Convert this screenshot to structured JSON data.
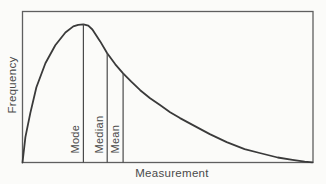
{
  "figure": {
    "y_axis_label": "Frequency",
    "x_axis_label": "Measurement"
  },
  "chart_data": {
    "type": "line",
    "title": "",
    "xlabel": "Measurement",
    "ylabel": "Frequency",
    "axis_ticks": "none",
    "grid": false,
    "legend": "none",
    "colors": {
      "curve": "#3a3a3a",
      "marker_line": "#4a4a4a",
      "frame": "#5f5f5f",
      "text": "#4a4a4a",
      "background": "#fbfbf9"
    },
    "curve_points_normalized": [
      [
        0.0,
        0.0
      ],
      [
        0.01,
        0.168
      ],
      [
        0.027,
        0.327
      ],
      [
        0.048,
        0.498
      ],
      [
        0.079,
        0.657
      ],
      [
        0.113,
        0.776
      ],
      [
        0.148,
        0.861
      ],
      [
        0.175,
        0.901
      ],
      [
        0.192,
        0.912
      ],
      [
        0.21,
        0.915
      ],
      [
        0.227,
        0.906
      ],
      [
        0.241,
        0.881
      ],
      [
        0.268,
        0.802
      ],
      [
        0.292,
        0.723
      ],
      [
        0.32,
        0.65
      ],
      [
        0.347,
        0.59
      ],
      [
        0.375,
        0.535
      ],
      [
        0.406,
        0.479
      ],
      [
        0.44,
        0.426
      ],
      [
        0.474,
        0.38
      ],
      [
        0.509,
        0.333
      ],
      [
        0.543,
        0.294
      ],
      [
        0.588,
        0.248
      ],
      [
        0.646,
        0.188
      ],
      [
        0.704,
        0.135
      ],
      [
        0.766,
        0.089
      ],
      [
        0.818,
        0.063
      ],
      [
        0.88,
        0.033
      ],
      [
        0.931,
        0.017
      ],
      [
        0.973,
        0.005
      ],
      [
        1.0,
        0.001
      ]
    ],
    "markers": [
      {
        "label": "Mode",
        "x": 0.21,
        "height": 0.915
      },
      {
        "label": "Median",
        "x": 0.292,
        "height": 0.723
      },
      {
        "label": "Mean",
        "x": 0.347,
        "height": 0.59
      }
    ]
  }
}
